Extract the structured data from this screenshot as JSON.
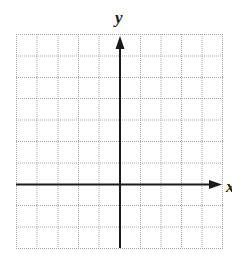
{
  "diagram": {
    "type": "coordinate-grid",
    "x_axis_label": "x",
    "y_axis_label": "y",
    "grid": {
      "columns": 10,
      "rows": 10,
      "line_color": "#a8a8a8",
      "line_style": "dotted"
    },
    "axes": {
      "color": "#1a1a1a",
      "y_axis_column_index": 5,
      "x_axis_row_index": 7
    }
  }
}
